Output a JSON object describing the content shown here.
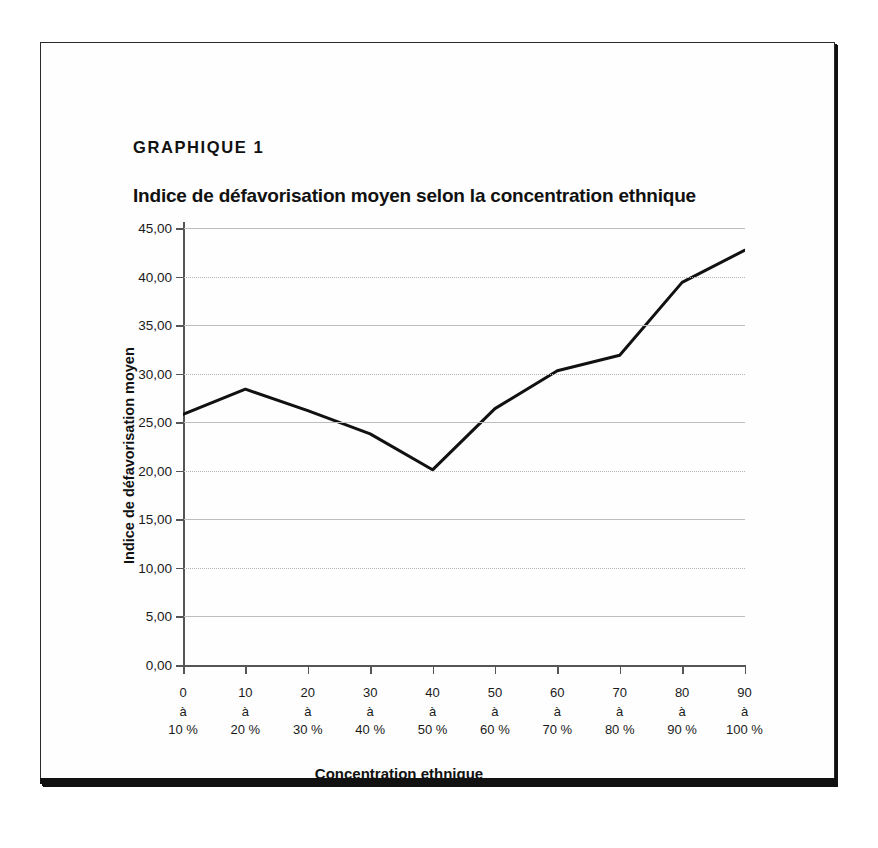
{
  "figure": {
    "label": "GRAPHIQUE 1",
    "title": "Indice de défavorisation moyen selon la concentration ethnique"
  },
  "chart_data": {
    "type": "line",
    "title": "Indice de défavorisation moyen selon la concentration ethnique",
    "xlabel": "Concentration ethnique",
    "ylabel": "Indice de défavorisation moyen",
    "categories": [
      "0 à 10 %",
      "10 à 20 %",
      "20 à 30 %",
      "30 à 40 %",
      "40 à 50 %",
      "50 à 60 %",
      "60 à 70 %",
      "70 à 80 %",
      "80 à 90 %",
      "90 à 100 %"
    ],
    "category_lines": [
      [
        "0",
        "à",
        "10 %"
      ],
      [
        "10",
        "à",
        "20 %"
      ],
      [
        "20",
        "à",
        "30 %"
      ],
      [
        "30",
        "à",
        "40 %"
      ],
      [
        "40",
        "à",
        "50 %"
      ],
      [
        "50",
        "à",
        "60 %"
      ],
      [
        "60",
        "à",
        "70 %"
      ],
      [
        "70",
        "à",
        "80 %"
      ],
      [
        "80",
        "à",
        "90 %"
      ],
      [
        "90",
        "à",
        "100 %"
      ]
    ],
    "values": [
      25.8,
      28.4,
      26.2,
      23.8,
      20.1,
      26.4,
      30.3,
      31.9,
      39.4,
      42.7
    ],
    "ylim": [
      0,
      45
    ],
    "ytick_values": [
      0,
      5,
      10,
      15,
      20,
      25,
      30,
      35,
      40,
      45
    ],
    "ytick_labels": [
      "0,00",
      "5,00",
      "10,00",
      "15,00",
      "20,00",
      "25,00",
      "30,00",
      "35,00",
      "40,00",
      "45,00"
    ],
    "grid": true,
    "legend": "none",
    "line_color": "#111111",
    "line_width": 3
  }
}
